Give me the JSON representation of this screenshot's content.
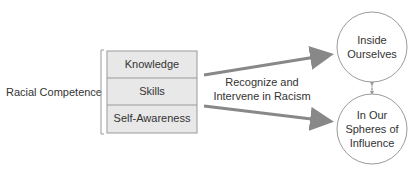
{
  "diagram": {
    "left_label": "Racial Competence",
    "stack": [
      "Knowledge",
      "Skills",
      "Self-Awareness"
    ],
    "center_label": [
      "Recognize and",
      "Intervene in Racism"
    ],
    "circles": [
      {
        "lines": [
          "Inside",
          "Ourselves"
        ]
      },
      {
        "lines": [
          "In Our",
          "Spheres of",
          "Influence"
        ]
      }
    ],
    "colors": {
      "box_fill": "#e8e8e8",
      "box_border": "#999999",
      "arrow": "#888888",
      "circle_border": "#999999"
    }
  }
}
